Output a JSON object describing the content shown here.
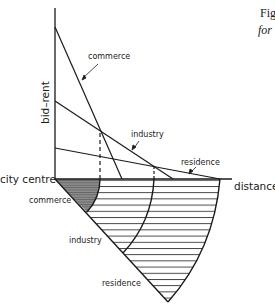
{
  "caption": {
    "line1": "Fig",
    "line2": "for"
  },
  "axes": {
    "y_label": "bid–rent",
    "x_label": "distance",
    "origin_label": "city centre"
  },
  "bid_rent_curves": [
    {
      "name": "commerce",
      "label": "commerce",
      "intercept_y_px": 27,
      "x_end_px": 122
    },
    {
      "name": "industry",
      "label": "industry",
      "intercept_y_px": 101,
      "x_end_px": 173
    },
    {
      "name": "residence",
      "label": "residence",
      "intercept_y_px": 148,
      "x_end_px": 220
    }
  ],
  "zones": [
    {
      "name": "commerce",
      "label": "commerce",
      "fill": "#8a8a8a",
      "hatch": "dense"
    },
    {
      "name": "industry",
      "label": "industry",
      "fill": "#ffffff",
      "hatch": "horizontal"
    },
    {
      "name": "residence",
      "label": "residence",
      "fill": "#ffffff",
      "hatch": "horizontal"
    }
  ],
  "colors": {
    "ink": "#1a1a1a",
    "commerce_shade": "#8a8a8a",
    "background": "#ffffff"
  }
}
